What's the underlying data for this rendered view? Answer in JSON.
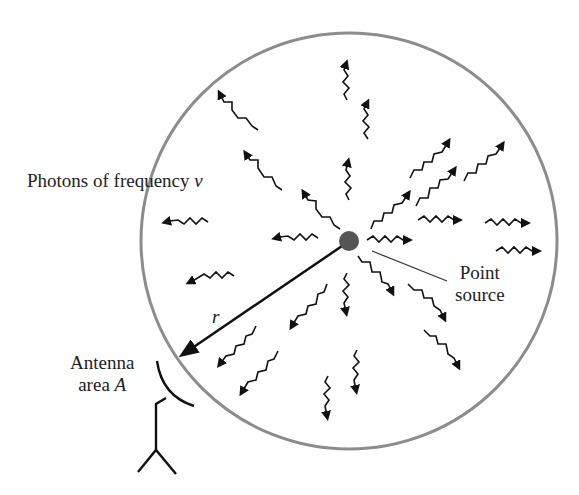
{
  "figure": {
    "labels": {
      "photons": "Photons of frequency",
      "photons_symbol": "ν",
      "point_source_line1": "Point",
      "point_source_line2": "source",
      "radius_symbol": "r",
      "antenna_line1": "Antenna",
      "antenna_line2_prefix": "area ",
      "antenna_symbol": "A"
    },
    "colors": {
      "sphere_outline": "#8c8c8c",
      "photon": "#111111",
      "source_fill": "#555555",
      "background": "#ffffff"
    },
    "sphere": {
      "cx": 349,
      "cy": 241,
      "r": 208
    },
    "source": {
      "cx": 349,
      "cy": 241,
      "r": 10
    }
  }
}
